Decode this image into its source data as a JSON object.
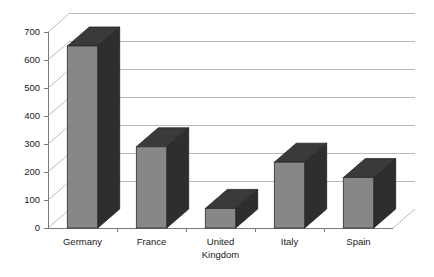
{
  "chart_data": {
    "type": "bar",
    "title": "",
    "subtitle": "",
    "xlabel": "",
    "ylabel": "",
    "categories": [
      "Germany",
      "France",
      "United Kingdom",
      "Italy",
      "Spain"
    ],
    "category_lines": [
      [
        "Germany"
      ],
      [
        "France"
      ],
      [
        "United",
        "Kingdom"
      ],
      [
        "Italy"
      ],
      [
        "Spain"
      ]
    ],
    "values": [
      650,
      290,
      70,
      235,
      180
    ],
    "ylim": [
      0,
      700
    ],
    "ytick_step": 100,
    "ytick_labels": [
      "0",
      "100",
      "200",
      "300",
      "400",
      "500",
      "600",
      "700"
    ],
    "ytick_values": [
      0,
      100,
      200,
      300,
      400,
      500,
      600,
      700
    ],
    "grid": true,
    "grid_axis": "y",
    "legend": false,
    "legend_position": "none",
    "style": "3d-column",
    "colors": {
      "bar_front": "#878787",
      "bar_top": "#3a3a3a",
      "bar_side": "#2e2e2e",
      "gridline": "#b9b9b9",
      "axis": "#7a7a7a",
      "text": "#1a1a1a",
      "background": "#ffffff"
    }
  }
}
